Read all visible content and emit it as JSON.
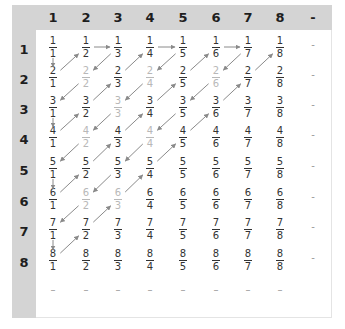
{
  "diagram": {
    "title": "",
    "column_headers": [
      "1",
      "2",
      "3",
      "4",
      "5",
      "6",
      "7",
      "8",
      "-"
    ],
    "row_headers": [
      "1",
      "2",
      "3",
      "4",
      "5",
      "6",
      "7",
      "8"
    ],
    "ellipsis_symbol": "–",
    "colors": {
      "frame": "#d4d4d4",
      "cell_background": "#ffffff",
      "fraction_text": "#333333",
      "reducible_fraction_text": "#b8b8b8",
      "arrow": "#8a8a8a",
      "header_text": "#1e1e1e"
    },
    "rows": [
      {
        "row": "1",
        "cells": [
          {
            "n": "1",
            "d": "1",
            "grey": false
          },
          {
            "n": "1",
            "d": "2",
            "grey": false
          },
          {
            "n": "1",
            "d": "3",
            "grey": false
          },
          {
            "n": "1",
            "d": "4",
            "grey": false
          },
          {
            "n": "1",
            "d": "5",
            "grey": false
          },
          {
            "n": "1",
            "d": "6",
            "grey": false
          },
          {
            "n": "1",
            "d": "7",
            "grey": false
          },
          {
            "n": "1",
            "d": "8",
            "grey": false
          }
        ]
      },
      {
        "row": "2",
        "cells": [
          {
            "n": "2",
            "d": "1",
            "grey": false
          },
          {
            "n": "2",
            "d": "2",
            "grey": true
          },
          {
            "n": "2",
            "d": "3",
            "grey": false
          },
          {
            "n": "2",
            "d": "4",
            "grey": true
          },
          {
            "n": "2",
            "d": "5",
            "grey": false
          },
          {
            "n": "2",
            "d": "6",
            "grey": true
          },
          {
            "n": "2",
            "d": "7",
            "grey": false
          },
          {
            "n": "2",
            "d": "8",
            "grey": false
          }
        ]
      },
      {
        "row": "3",
        "cells": [
          {
            "n": "3",
            "d": "1",
            "grey": false
          },
          {
            "n": "3",
            "d": "2",
            "grey": false
          },
          {
            "n": "3",
            "d": "3",
            "grey": true
          },
          {
            "n": "3",
            "d": "4",
            "grey": false
          },
          {
            "n": "3",
            "d": "5",
            "grey": false
          },
          {
            "n": "3",
            "d": "6",
            "grey": false
          },
          {
            "n": "3",
            "d": "7",
            "grey": false
          },
          {
            "n": "3",
            "d": "8",
            "grey": false
          }
        ]
      },
      {
        "row": "4",
        "cells": [
          {
            "n": "4",
            "d": "1",
            "grey": false
          },
          {
            "n": "4",
            "d": "2",
            "grey": true
          },
          {
            "n": "4",
            "d": "3",
            "grey": false
          },
          {
            "n": "4",
            "d": "4",
            "grey": true
          },
          {
            "n": "4",
            "d": "5",
            "grey": false
          },
          {
            "n": "4",
            "d": "6",
            "grey": false
          },
          {
            "n": "4",
            "d": "7",
            "grey": false
          },
          {
            "n": "4",
            "d": "8",
            "grey": false
          }
        ]
      },
      {
        "row": "5",
        "cells": [
          {
            "n": "5",
            "d": "1",
            "grey": false
          },
          {
            "n": "5",
            "d": "2",
            "grey": false
          },
          {
            "n": "5",
            "d": "3",
            "grey": false
          },
          {
            "n": "5",
            "d": "4",
            "grey": false
          },
          {
            "n": "5",
            "d": "5",
            "grey": false
          },
          {
            "n": "5",
            "d": "6",
            "grey": false
          },
          {
            "n": "5",
            "d": "7",
            "grey": false
          },
          {
            "n": "5",
            "d": "8",
            "grey": false
          }
        ]
      },
      {
        "row": "6",
        "cells": [
          {
            "n": "6",
            "d": "1",
            "grey": false
          },
          {
            "n": "6",
            "d": "2",
            "grey": true
          },
          {
            "n": "6",
            "d": "3",
            "grey": true
          },
          {
            "n": "6",
            "d": "4",
            "grey": false
          },
          {
            "n": "6",
            "d": "5",
            "grey": false
          },
          {
            "n": "6",
            "d": "6",
            "grey": false
          },
          {
            "n": "6",
            "d": "7",
            "grey": false
          },
          {
            "n": "6",
            "d": "8",
            "grey": false
          }
        ]
      },
      {
        "row": "7",
        "cells": [
          {
            "n": "7",
            "d": "1",
            "grey": false
          },
          {
            "n": "7",
            "d": "2",
            "grey": false
          },
          {
            "n": "7",
            "d": "3",
            "grey": false
          },
          {
            "n": "7",
            "d": "4",
            "grey": false
          },
          {
            "n": "7",
            "d": "5",
            "grey": false
          },
          {
            "n": "7",
            "d": "6",
            "grey": false
          },
          {
            "n": "7",
            "d": "7",
            "grey": false
          },
          {
            "n": "7",
            "d": "8",
            "grey": false
          }
        ]
      },
      {
        "row": "8",
        "cells": [
          {
            "n": "8",
            "d": "1",
            "grey": false
          },
          {
            "n": "8",
            "d": "2",
            "grey": false
          },
          {
            "n": "8",
            "d": "3",
            "grey": false
          },
          {
            "n": "8",
            "d": "4",
            "grey": false
          },
          {
            "n": "8",
            "d": "5",
            "grey": false
          },
          {
            "n": "8",
            "d": "6",
            "grey": false
          },
          {
            "n": "8",
            "d": "7",
            "grey": false
          },
          {
            "n": "8",
            "d": "8",
            "grey": false
          }
        ]
      }
    ],
    "row_end_symbol": "-",
    "path": [
      [
        1,
        1
      ],
      [
        2,
        1
      ],
      [
        1,
        2
      ],
      [
        1,
        3
      ],
      [
        2,
        2
      ],
      [
        3,
        1
      ],
      [
        4,
        1
      ],
      [
        3,
        2
      ],
      [
        2,
        3
      ],
      [
        1,
        4
      ],
      [
        1,
        5
      ],
      [
        2,
        4
      ],
      [
        3,
        3
      ],
      [
        4,
        2
      ],
      [
        5,
        1
      ],
      [
        6,
        1
      ],
      [
        5,
        2
      ],
      [
        4,
        3
      ],
      [
        3,
        4
      ],
      [
        2,
        5
      ],
      [
        1,
        6
      ],
      [
        1,
        7
      ],
      [
        2,
        6
      ],
      [
        3,
        5
      ],
      [
        4,
        4
      ],
      [
        5,
        3
      ],
      [
        6,
        2
      ],
      [
        7,
        1
      ],
      [
        8,
        1
      ],
      [
        7,
        2
      ],
      [
        6,
        3
      ],
      [
        5,
        4
      ],
      [
        4,
        5
      ],
      [
        3,
        6
      ],
      [
        2,
        7
      ],
      [
        1,
        8
      ]
    ]
  }
}
